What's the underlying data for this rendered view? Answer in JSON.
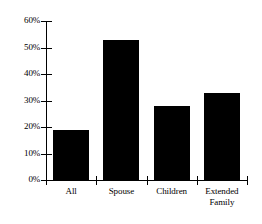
{
  "chart_data": {
    "type": "bar",
    "title": "",
    "subtitle": "",
    "xlabel": "",
    "ylabel": "",
    "categories": [
      "All",
      "Spouse",
      "Children",
      "Extended Family"
    ],
    "category_lines": [
      [
        "All"
      ],
      [
        "Spouse"
      ],
      [
        "Children"
      ],
      [
        "Extended",
        "Family"
      ]
    ],
    "values": [
      19,
      53,
      28,
      33
    ],
    "ylim": [
      0,
      60
    ],
    "yticks": [
      0,
      10,
      20,
      30,
      40,
      50,
      60
    ],
    "ytick_labels": [
      "0%",
      "10%",
      "20%",
      "30%",
      "40%",
      "50%",
      "60%"
    ],
    "grid": false,
    "legend": false,
    "bar_color": "#000000",
    "axis_color": "#000000",
    "background_color": "#ffffff"
  }
}
